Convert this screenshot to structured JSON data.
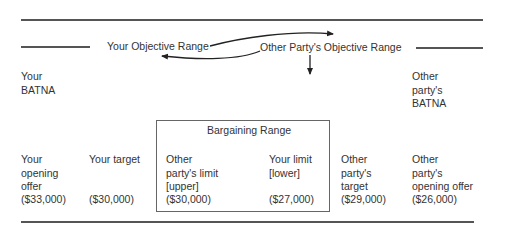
{
  "diagram": {
    "objective_ranges": {
      "yours": "Your Objective Range",
      "other": "Other Party's Objective Range"
    },
    "batna": {
      "yours": "Your\nBATNA",
      "other": "Other\nparty's\nBATNA"
    },
    "bargaining_range": {
      "title": "Bargaining Range"
    },
    "points": [
      {
        "label": "Your\nopening\noffer",
        "value": "($33,000)"
      },
      {
        "label": "Your target",
        "value": "($30,000)"
      },
      {
        "label": "Other\nparty's limit\n[upper]",
        "value": "($30,000)"
      },
      {
        "label": "Your limit\n[lower]",
        "value": "($27,000)"
      },
      {
        "label": "Other\nparty's\ntarget",
        "value": "($29,000)"
      },
      {
        "label": "Other\nparty's\nopening offer",
        "value": "($26,000)"
      }
    ],
    "colors": {
      "line": "#555555",
      "text": "#333333",
      "box_border": "#666666"
    }
  }
}
